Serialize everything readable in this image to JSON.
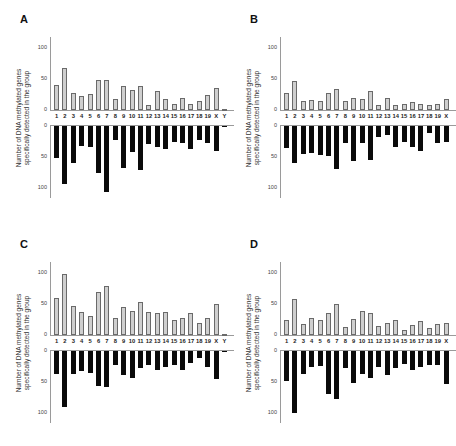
{
  "figure": {
    "ylabel_line1": "Number of DNA methylated genes",
    "ylabel_line2": "specifically detected in the group",
    "ticks": [
      "100",
      "50",
      "0"
    ],
    "colors": {
      "top_bars": "#cfcfcf",
      "bottom_bars": "#0a0a0a",
      "axis": "#9a9a9a"
    }
  },
  "chart_data": [
    {
      "panel": "A",
      "type": "bar",
      "title": "A",
      "ylabel": "Number of DNA methylated genes specifically detected in the group",
      "categories": [
        "1",
        "2",
        "3",
        "4",
        "5",
        "6",
        "7",
        "8",
        "9",
        "10",
        "11",
        "12",
        "13",
        "14",
        "15",
        "16",
        "17",
        "18",
        "19",
        "X",
        "Y"
      ],
      "series": [
        {
          "name": "upper (gray)",
          "values": [
            40,
            68,
            28,
            22,
            26,
            48,
            48,
            18,
            38,
            33,
            38,
            8,
            30,
            17,
            10,
            20,
            10,
            15,
            24,
            36,
            1
          ]
        },
        {
          "name": "lower (black)",
          "values": [
            51,
            93,
            59,
            32,
            34,
            76,
            106,
            22,
            67,
            42,
            71,
            29,
            34,
            37,
            26,
            28,
            37,
            22,
            27,
            40,
            2
          ]
        }
      ],
      "ylim": [
        -120,
        120
      ],
      "yticks_upper": [
        0,
        50,
        100
      ],
      "yticks_lower": [
        0,
        50,
        100
      ]
    },
    {
      "panel": "B",
      "type": "bar",
      "title": "B",
      "ylabel": "Number of DNA methylated genes specifically detected in the group",
      "categories": [
        "1",
        "2",
        "3",
        "4",
        "5",
        "6",
        "7",
        "8",
        "9",
        "10",
        "11",
        "12",
        "13",
        "14",
        "15",
        "16",
        "17",
        "18",
        "19",
        "X"
      ],
      "series": [
        {
          "name": "upper (gray)",
          "values": [
            27,
            46,
            14,
            16,
            14,
            27,
            34,
            14,
            19,
            18,
            31,
            8,
            19,
            8,
            9,
            13,
            10,
            8,
            10,
            17
          ]
        },
        {
          "name": "lower (black)",
          "values": [
            35,
            60,
            45,
            44,
            46,
            48,
            69,
            27,
            56,
            27,
            55,
            18,
            15,
            34,
            25,
            34,
            40,
            12,
            28,
            26
          ]
        }
      ],
      "ylim": [
        -120,
        120
      ],
      "yticks_upper": [
        0,
        50,
        100
      ],
      "yticks_lower": [
        0,
        50,
        100
      ]
    },
    {
      "panel": "C",
      "type": "bar",
      "title": "C",
      "ylabel": "Number of DNA methylated genes specifically detected in the group",
      "categories": [
        "1",
        "2",
        "3",
        "4",
        "5",
        "6",
        "7",
        "8",
        "9",
        "10",
        "11",
        "12",
        "13",
        "14",
        "15",
        "16",
        "17",
        "18",
        "19",
        "X",
        "Y"
      ],
      "series": [
        {
          "name": "upper (gray)",
          "values": [
            60,
            99,
            47,
            37,
            31,
            70,
            79,
            28,
            45,
            39,
            53,
            37,
            36,
            37,
            25,
            27,
            35,
            20,
            27,
            50,
            1
          ]
        },
        {
          "name": "lower (black)",
          "values": [
            37,
            90,
            37,
            32,
            35,
            57,
            58,
            22,
            39,
            43,
            28,
            23,
            30,
            26,
            23,
            30,
            20,
            12,
            25,
            45,
            2
          ]
        }
      ],
      "ylim": [
        -120,
        120
      ],
      "yticks_upper": [
        0,
        50,
        100
      ],
      "yticks_lower": [
        0,
        50,
        100
      ]
    },
    {
      "panel": "D",
      "type": "bar",
      "title": "D",
      "ylabel": "Number of DNA methylated genes specifically detected in the group",
      "categories": [
        "1",
        "2",
        "3",
        "4",
        "5",
        "6",
        "7",
        "8",
        "9",
        "10",
        "11",
        "12",
        "13",
        "14",
        "15",
        "16",
        "17",
        "18",
        "19",
        "X"
      ],
      "series": [
        {
          "name": "upper (gray)",
          "values": [
            24,
            58,
            18,
            28,
            25,
            35,
            50,
            13,
            26,
            39,
            35,
            14,
            19,
            24,
            8,
            16,
            23,
            11,
            17,
            19
          ]
        },
        {
          "name": "lower (black)",
          "values": [
            48,
            100,
            37,
            25,
            24,
            69,
            77,
            28,
            51,
            37,
            44,
            25,
            39,
            27,
            21,
            31,
            26,
            23,
            22,
            53
          ]
        }
      ],
      "ylim": [
        -120,
        120
      ],
      "yticks_upper": [
        0,
        50,
        100
      ],
      "yticks_lower": [
        0,
        50,
        100
      ]
    }
  ]
}
